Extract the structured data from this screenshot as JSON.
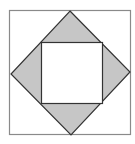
{
  "figure": {
    "colors": {
      "background": "#ffffff",
      "outer_stroke": "#8a8a8a",
      "diamond_stroke": "#333333",
      "shade_fill": "#c6c6c6",
      "inner_fill": "#ffffff"
    },
    "outer_square": {
      "x": 9,
      "y": 10,
      "w": 121,
      "h": 125
    },
    "diamond": {
      "top": [
        70,
        11
      ],
      "right": [
        130,
        72
      ],
      "bottom": [
        71,
        135
      ],
      "left": [
        11,
        74
      ]
    },
    "inner_square": {
      "x": 41,
      "y": 42,
      "w": 61,
      "h": 61
    }
  }
}
